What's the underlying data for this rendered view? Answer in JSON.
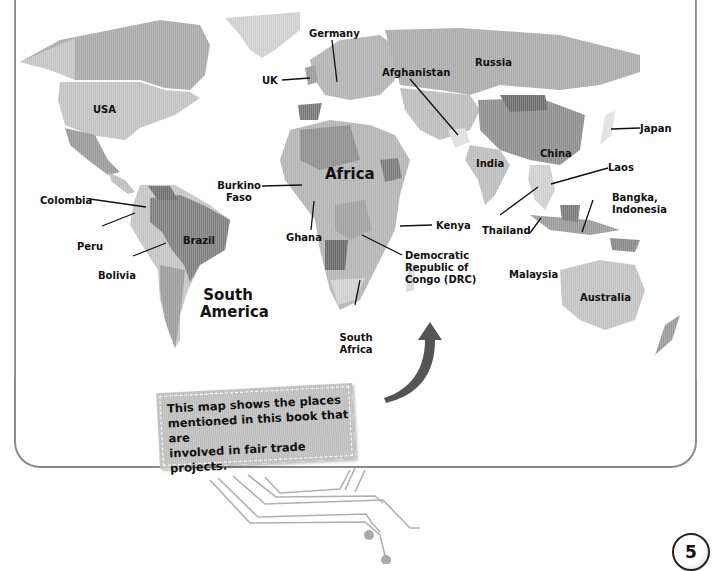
{
  "map": {
    "title": "World map of fair trade places",
    "continents": {
      "africa": "Africa",
      "south_america_line1": "South",
      "south_america_line2": "America"
    },
    "countries": {
      "usa": "USA",
      "russia": "Russia",
      "china": "China",
      "india": "India",
      "brazil": "Brazil",
      "australia": "Australia"
    },
    "callout_labels": {
      "germany": "Germany",
      "uk": "UK",
      "afghanistan": "Afghanistan",
      "japan": "Japan",
      "laos": "Laos",
      "bangka_line1": "Bangka,",
      "bangka_line2": "Indonesia",
      "thailand": "Thailand",
      "malaysia": "Malaysia",
      "kenya": "Kenya",
      "drc_line1": "Democratic",
      "drc_line2": "Republic of",
      "drc_line3": "Congo (DRC)",
      "south_africa_line1": "South",
      "south_africa_line2": "Africa",
      "ghana": "Ghana",
      "burkina_line1": "Burkino",
      "burkina_line2": "Faso",
      "colombia": "Colombia",
      "peru": "Peru",
      "bolivia": "Bolivia"
    }
  },
  "callout_box": {
    "line1": "This map shows the places",
    "line2": "mentioned in this book that are",
    "line3": "involved in fair trade projects."
  },
  "page_number": "5",
  "colors": {
    "land_light": "#c8c8c8",
    "land_mid": "#a8a8a8",
    "land_dark": "#7a7a7a",
    "land_pale": "#e2e2e2",
    "frame": "#8a8a8a"
  }
}
